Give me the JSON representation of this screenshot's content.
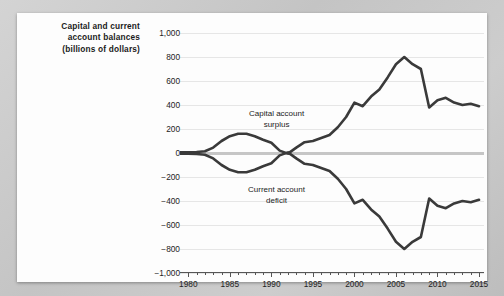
{
  "card": {
    "title_lines": [
      "Capital and current",
      "account balances",
      "(billions of dollars)"
    ]
  },
  "annotations": {
    "capital_line1": "Capital account",
    "capital_line2": "surplus",
    "current_line1": "Current account",
    "current_line2": "deficit"
  },
  "colors": {
    "line": "#3a3a3a",
    "zero_line": "#c6c6c6",
    "gridline": "#e6e6e6",
    "axis": "#565656",
    "text": "#1b1b1b",
    "card_background": "#fdfdfd",
    "page_background": "#c9c9c9"
  },
  "chart_data": {
    "type": "line",
    "title": "Capital and current account balances (billions of dollars)",
    "xlabel": "",
    "ylabel": "Capital and current account balances (billions of dollars)",
    "xlim": [
      1979,
      2015.6
    ],
    "ylim": [
      -1000,
      1000
    ],
    "grid": true,
    "legend": "inline-annotations",
    "ytick_labels": [
      "1,000",
      "800",
      "600",
      "400",
      "200",
      "0",
      "−200",
      "−400",
      "−600",
      "−800",
      "−1,000"
    ],
    "ytick_values": [
      1000,
      800,
      600,
      400,
      200,
      0,
      -200,
      -400,
      -600,
      -800,
      -1000
    ],
    "xtick_labels": [
      "1980",
      "1985",
      "1990",
      "1995",
      "2000",
      "2005",
      "2010",
      "2015"
    ],
    "xtick_values": [
      1980,
      1985,
      1990,
      1995,
      2000,
      2005,
      2010,
      2015
    ],
    "x_minor_step": 1,
    "x": [
      1979,
      1980,
      1981,
      1982,
      1983,
      1984,
      1985,
      1986,
      1987,
      1988,
      1989,
      1990,
      1991,
      1992,
      1993,
      1994,
      1995,
      1996,
      1997,
      1998,
      1999,
      2000,
      2001,
      2002,
      2003,
      2004,
      2005,
      2006,
      2007,
      2008,
      2009,
      2010,
      2011,
      2012,
      2013,
      2014,
      2015
    ],
    "series": [
      {
        "name": "Capital account surplus",
        "values": [
          5,
          5,
          8,
          15,
          45,
          100,
          140,
          160,
          160,
          140,
          110,
          85,
          20,
          -5,
          45,
          90,
          100,
          125,
          150,
          215,
          300,
          420,
          390,
          470,
          530,
          630,
          740,
          800,
          740,
          700,
          380,
          440,
          460,
          420,
          400,
          410,
          390
        ]
      },
      {
        "name": "Current account deficit",
        "values": [
          -5,
          -5,
          -8,
          -15,
          -45,
          -100,
          -140,
          -160,
          -160,
          -140,
          -110,
          -85,
          -20,
          5,
          -45,
          -90,
          -100,
          -125,
          -150,
          -215,
          -300,
          -420,
          -390,
          -470,
          -530,
          -630,
          -740,
          -800,
          -740,
          -700,
          -380,
          -440,
          -460,
          -420,
          -400,
          -410,
          -390
        ]
      }
    ]
  }
}
